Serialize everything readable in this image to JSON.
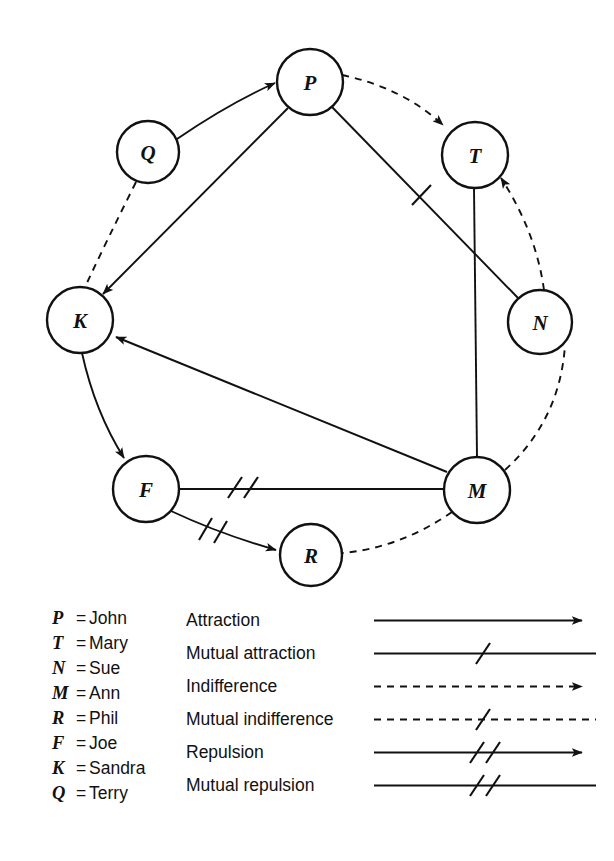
{
  "diagram": {
    "type": "sociogram",
    "nodes": [
      {
        "id": "P",
        "label": "P",
        "cx": 310,
        "cy": 82,
        "r": 33
      },
      {
        "id": "T",
        "label": "T",
        "cx": 475,
        "cy": 155,
        "r": 33
      },
      {
        "id": "N",
        "label": "N",
        "cx": 540,
        "cy": 322,
        "r": 32
      },
      {
        "id": "M",
        "label": "M",
        "cx": 477,
        "cy": 490,
        "r": 33
      },
      {
        "id": "R",
        "label": "R",
        "cx": 311,
        "cy": 555,
        "r": 31
      },
      {
        "id": "F",
        "label": "F",
        "cx": 146,
        "cy": 489,
        "r": 33
      },
      {
        "id": "K",
        "label": "K",
        "cx": 80,
        "cy": 320,
        "r": 33
      },
      {
        "id": "Q",
        "label": "Q",
        "cx": 148,
        "cy": 152,
        "r": 31
      }
    ],
    "edges": [
      {
        "from": "Q",
        "to": "P",
        "relation": "attraction",
        "directed": true,
        "style": "solid",
        "ticks": 0
      },
      {
        "from": "Q",
        "to": "K",
        "relation": "indifference",
        "directed": false,
        "style": "dashed",
        "ticks": 0
      },
      {
        "from": "P",
        "to": "T",
        "relation": "indifference",
        "directed": true,
        "style": "dashed",
        "ticks": 0
      },
      {
        "from": "P",
        "to": "K",
        "relation": "attraction",
        "directed": true,
        "style": "solid",
        "ticks": 0
      },
      {
        "from": "P",
        "to": "N",
        "relation": "mutual attraction",
        "directed": false,
        "style": "solid",
        "ticks": 1
      },
      {
        "from": "T",
        "to": "M",
        "relation": "mutual attraction",
        "directed": false,
        "style": "solid",
        "ticks": 0
      },
      {
        "from": "M",
        "to": "N",
        "relation": "indifference",
        "directed": false,
        "style": "dashed",
        "ticks": 0
      },
      {
        "from": "M",
        "to": "T",
        "relation": "indifference",
        "directed": true,
        "style": "dashed",
        "ticks": 0
      },
      {
        "from": "M",
        "to": "K",
        "relation": "attraction",
        "directed": true,
        "style": "solid",
        "ticks": 0
      },
      {
        "from": "M",
        "to": "F",
        "relation": "mutual repulsion",
        "directed": false,
        "style": "solid",
        "ticks": 2
      },
      {
        "from": "M",
        "to": "R",
        "relation": "indifference",
        "directed": false,
        "style": "dashed",
        "ticks": 0
      },
      {
        "from": "K",
        "to": "F",
        "relation": "attraction",
        "directed": true,
        "style": "solid",
        "ticks": 0
      },
      {
        "from": "F",
        "to": "R",
        "relation": "repulsion",
        "directed": true,
        "style": "solid",
        "ticks": 2
      }
    ]
  },
  "names": {
    "heading": "",
    "rows": [
      {
        "key": "P",
        "eq": "=",
        "value": "John"
      },
      {
        "key": "T",
        "eq": "=",
        "value": "Mary"
      },
      {
        "key": "N",
        "eq": "=",
        "value": "Sue"
      },
      {
        "key": "M",
        "eq": "=",
        "value": "Ann"
      },
      {
        "key": "R",
        "eq": "=",
        "value": "Phil"
      },
      {
        "key": "F",
        "eq": "=",
        "value": "Joe"
      },
      {
        "key": "K",
        "eq": "=",
        "value": "Sandra"
      },
      {
        "key": "Q",
        "eq": "=",
        "value": "Terry"
      }
    ]
  },
  "key": {
    "rows": [
      {
        "label": "Attraction",
        "style": "solid",
        "arrow": true,
        "ticks": 0
      },
      {
        "label": "Mutual attraction",
        "style": "solid",
        "arrow": false,
        "ticks": 1
      },
      {
        "label": "Indifference",
        "style": "dashed",
        "arrow": true,
        "ticks": 0
      },
      {
        "label": "Mutual indifference",
        "style": "dashed",
        "arrow": false,
        "ticks": 1
      },
      {
        "label": "Repulsion",
        "style": "solid",
        "arrow": true,
        "ticks": 2
      },
      {
        "label": "Mutual repulsion",
        "style": "solid",
        "arrow": false,
        "ticks": 2
      }
    ]
  },
  "colors": {
    "ink": "#111111",
    "paper": "#ffffff"
  }
}
